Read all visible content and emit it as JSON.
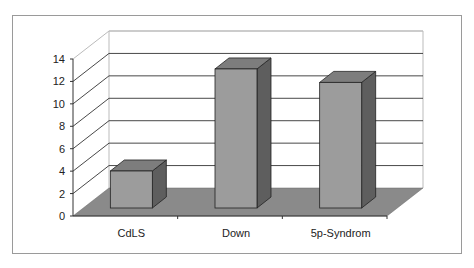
{
  "chart_data": {
    "type": "bar",
    "style": "3d-column",
    "title": "",
    "xlabel": "",
    "ylabel": "",
    "categories": [
      "CdLS",
      "Down",
      "5p-Syndrom"
    ],
    "values": [
      3.3,
      12.4,
      11.2
    ],
    "ylim": [
      0,
      14
    ],
    "yticks": [
      "0",
      "2",
      "4",
      "6",
      "8",
      "10",
      "12",
      "14"
    ],
    "grid": true,
    "legend": null,
    "colors": {
      "bar_front": "#9c9c9c",
      "bar_top": "#7d7d7d",
      "bar_side": "#5e5e5e",
      "floor": "#8a8a8a",
      "grid": "#333333",
      "frame": "#9a9a9a"
    }
  }
}
